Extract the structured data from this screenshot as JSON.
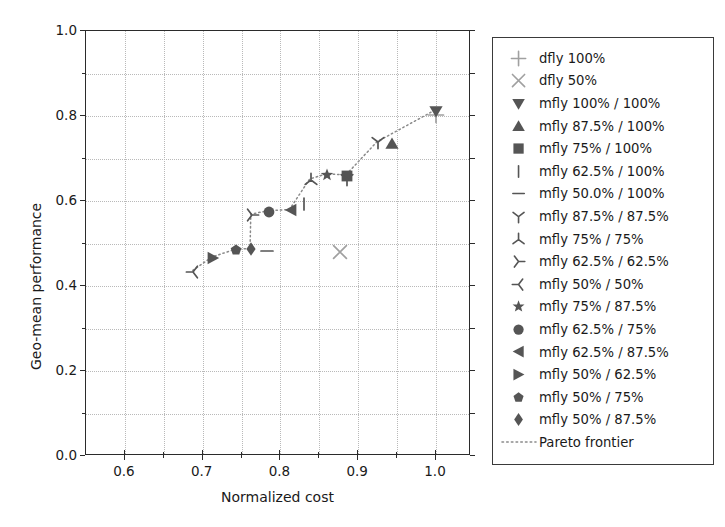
{
  "chart_data": {
    "type": "scatter",
    "title": "",
    "xlabel": "Normalized cost",
    "ylabel": "Geo-mean performance",
    "xlim": [
      0.55,
      1.045
    ],
    "ylim": [
      0.0,
      1.0
    ],
    "xticks": [
      "0.6",
      "0.7",
      "0.8",
      "0.9",
      "1.0"
    ],
    "xtick_values": [
      0.6,
      0.7,
      0.8,
      0.9,
      1.0
    ],
    "xminor_values": [
      0.65,
      0.75,
      0.85,
      0.95
    ],
    "yticks": [
      "0.0",
      "0.2",
      "0.4",
      "0.6",
      "0.8",
      "1.0"
    ],
    "ytick_values": [
      0.0,
      0.2,
      0.4,
      0.6,
      0.8,
      1.0
    ],
    "yminor_values": [
      0.1,
      0.3,
      0.5,
      0.7,
      0.9
    ],
    "grid": true,
    "grid_style": "dotted",
    "legend_position": "outside-right",
    "colors": {
      "dfly_marker": "#a0a0a0",
      "mfly_marker": "#555555",
      "frontier_line": "#8a8a8a",
      "axis": "#2b2b2b",
      "grid": "#b9b9b9",
      "text": "#1a1a1a"
    },
    "points": [
      {
        "label": "dfly 100%",
        "marker": "plus",
        "x": 1.0,
        "y": 0.803,
        "color": "#a0a0a0"
      },
      {
        "label": "dfly 50%",
        "marker": "x",
        "x": 0.877,
        "y": 0.479,
        "color": "#a0a0a0"
      },
      {
        "label": "mfly 100% / 100%",
        "marker": "triangle_down",
        "x": 1.0,
        "y": 0.812,
        "color": "#555555"
      },
      {
        "label": "mfly 87.5% / 100%",
        "marker": "triangle_up",
        "x": 0.944,
        "y": 0.733,
        "color": "#555555"
      },
      {
        "label": "mfly 75% / 100%",
        "marker": "square",
        "x": 0.886,
        "y": 0.66,
        "color": "#555555"
      },
      {
        "label": "mfly 62.5% / 100%",
        "marker": "vline",
        "x": 0.83,
        "y": 0.592,
        "color": "#555555"
      },
      {
        "label": "mfly 50.0% / 100%",
        "marker": "hline",
        "x": 0.783,
        "y": 0.482,
        "color": "#555555"
      },
      {
        "label": "mfly 87.5% / 87.5%",
        "marker": "tri_up",
        "x": 0.886,
        "y": 0.652,
        "color": "#555555"
      },
      {
        "label": "mfly 75% / 75%",
        "marker": "tri_down",
        "x": 0.839,
        "y": 0.65,
        "color": "#555555"
      },
      {
        "label": "mfly 62.5% / 62.5%",
        "marker": "tri_left",
        "x": 0.763,
        "y": 0.567,
        "color": "#555555"
      },
      {
        "label": "mfly 50% / 50%",
        "marker": "tri_right",
        "x": 0.688,
        "y": 0.434,
        "color": "#555555"
      },
      {
        "label": "mfly 75% / 87.5%",
        "marker": "star",
        "x": 0.86,
        "y": 0.662,
        "color": "#555555"
      },
      {
        "label": "mfly 62.5% / 75%",
        "marker": "circle",
        "x": 0.785,
        "y": 0.575,
        "color": "#555555"
      },
      {
        "label": "mfly 62.5% / 87.5%",
        "marker": "triangle_left",
        "x": 0.813,
        "y": 0.578,
        "color": "#555555"
      },
      {
        "label": "mfly 50% / 62.5%",
        "marker": "triangle_right",
        "x": 0.713,
        "y": 0.466,
        "color": "#555555"
      },
      {
        "label": "mfly 50% / 75%",
        "marker": "pentagon",
        "x": 0.743,
        "y": 0.484,
        "color": "#555555"
      },
      {
        "label": "mfly 50% / 87.5%",
        "marker": "diamond",
        "x": 0.762,
        "y": 0.486,
        "color": "#555555"
      },
      {
        "label": "mfly 87.5% / 87.5% b",
        "marker": "tri_up",
        "x": 0.926,
        "y": 0.738,
        "color": "#555555"
      }
    ],
    "pareto_frontier": {
      "label": "Pareto frontier",
      "style": "dotted",
      "points": [
        {
          "x": 0.688,
          "y": 0.434
        },
        {
          "x": 0.713,
          "y": 0.466
        },
        {
          "x": 0.743,
          "y": 0.484
        },
        {
          "x": 0.762,
          "y": 0.486
        },
        {
          "x": 0.763,
          "y": 0.567
        },
        {
          "x": 0.785,
          "y": 0.575
        },
        {
          "x": 0.813,
          "y": 0.578
        },
        {
          "x": 0.839,
          "y": 0.65
        },
        {
          "x": 0.86,
          "y": 0.662
        },
        {
          "x": 0.886,
          "y": 0.66
        },
        {
          "x": 0.926,
          "y": 0.738
        },
        {
          "x": 1.0,
          "y": 0.812
        }
      ]
    },
    "legend": [
      {
        "label": "dfly 100%",
        "marker": "plus",
        "color": "#a0a0a0"
      },
      {
        "label": "dfly 50%",
        "marker": "x",
        "color": "#a0a0a0"
      },
      {
        "label": "mfly 100% / 100%",
        "marker": "triangle_down",
        "color": "#555555"
      },
      {
        "label": "mfly 87.5% / 100%",
        "marker": "triangle_up",
        "color": "#555555"
      },
      {
        "label": "mfly 75% / 100%",
        "marker": "square",
        "color": "#555555"
      },
      {
        "label": "mfly 62.5% / 100%",
        "marker": "vline",
        "color": "#555555"
      },
      {
        "label": "mfly 50.0% / 100%",
        "marker": "hline",
        "color": "#555555"
      },
      {
        "label": "mfly 87.5% / 87.5%",
        "marker": "tri_up",
        "color": "#555555"
      },
      {
        "label": "mfly 75% / 75%",
        "marker": "tri_down",
        "color": "#555555"
      },
      {
        "label": "mfly 62.5% / 62.5%",
        "marker": "tri_left",
        "color": "#555555"
      },
      {
        "label": "mfly 50% / 50%",
        "marker": "tri_right",
        "color": "#555555"
      },
      {
        "label": "mfly 75% / 87.5%",
        "marker": "star",
        "color": "#555555"
      },
      {
        "label": "mfly 62.5% / 75%",
        "marker": "circle",
        "color": "#555555"
      },
      {
        "label": "mfly 62.5% / 87.5%",
        "marker": "triangle_left",
        "color": "#555555"
      },
      {
        "label": "mfly 50% / 62.5%",
        "marker": "triangle_right",
        "color": "#555555"
      },
      {
        "label": "mfly 50% / 75%",
        "marker": "pentagon",
        "color": "#555555"
      },
      {
        "label": "mfly 50% / 87.5%",
        "marker": "diamond",
        "color": "#555555"
      },
      {
        "label": "Pareto frontier",
        "marker": "dotted_line",
        "color": "#8a8a8a"
      }
    ]
  }
}
